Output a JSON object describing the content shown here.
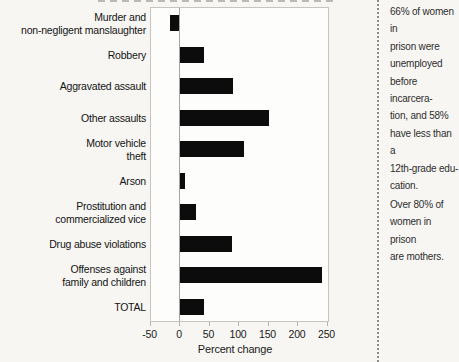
{
  "chart_data": {
    "type": "bar",
    "orientation": "horizontal",
    "title": "",
    "categories": [
      "Murder and\nnon-negligent manslaughter",
      "Robbery",
      "Aggravated assault",
      "Other assaults",
      "Motor vehicle\ntheft",
      "Arson",
      "Prostitution and\ncommercialized vice",
      "Drug abuse violations",
      "Offenses against\nfamily and children",
      "TOTAL"
    ],
    "values": [
      -16,
      41,
      90,
      150,
      108,
      8,
      27,
      88,
      240,
      40
    ],
    "xlabel": "Percent change",
    "ylabel": "",
    "x_ticks": [
      -50,
      0,
      50,
      100,
      150,
      200,
      250
    ],
    "xlim": [
      -48,
      255
    ],
    "grid": "zero-line-only",
    "legend": "none",
    "bar_color": "#0c0c0c"
  },
  "sidebar": {
    "note_1": "66% of women in\nprison were\nunemployed\nbefore incarcera-\ntion, and 58%\nhave less than a\n12th-grade edu-\ncation.",
    "note_2": "Over 80% of\nwomen in prison\nare mothers."
  }
}
